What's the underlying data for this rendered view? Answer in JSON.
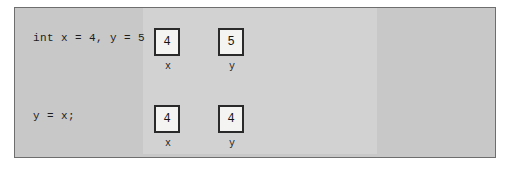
{
  "diagram": {
    "colors": {
      "page_background": "#ffffff",
      "frame_background": "#c8c8c8",
      "frame_border": "#6e6e6e",
      "inner_panel_background": "#d2d2d2",
      "box_fill": "#f4f4f2",
      "box_border": "#2a2a2a",
      "text": "#1c1c1c"
    },
    "rows": [
      {
        "code": "int x = 4, y = 5",
        "cells": [
          {
            "value": "4",
            "label": "x"
          },
          {
            "value": "5",
            "label": "y"
          }
        ]
      },
      {
        "code": "y = x;",
        "cells": [
          {
            "value": "4",
            "label": "x"
          },
          {
            "value": "4",
            "label": "y"
          }
        ]
      }
    ]
  }
}
